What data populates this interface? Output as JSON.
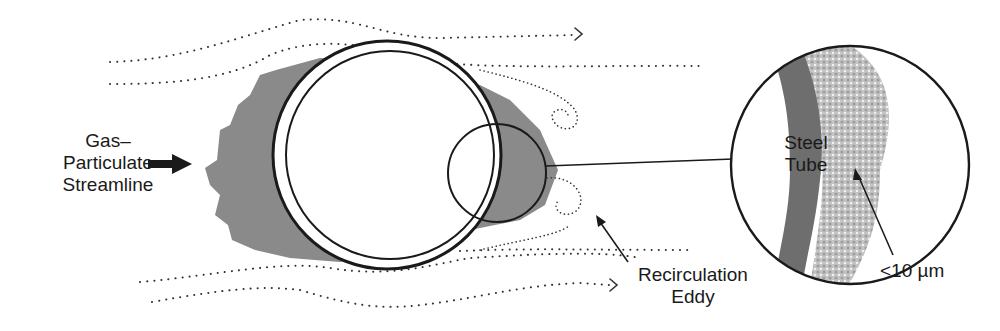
{
  "figure": {
    "type": "schematic",
    "labels": {
      "inlet": [
        "Gas–",
        "Particulate",
        "Streamline"
      ],
      "tube": [
        "Steel",
        "Tube"
      ],
      "eddy": [
        "Recirculation",
        "Eddy"
      ],
      "particle_size": "<10 µm"
    },
    "colors": {
      "deposit_dark": "#7a7a7a",
      "deposit_light": "#b8b8b8",
      "tube_wall": "#6e6e6e",
      "line": "#1a1a1a"
    }
  }
}
